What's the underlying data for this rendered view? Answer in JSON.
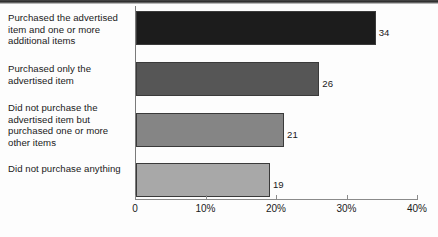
{
  "chart_data": {
    "type": "bar",
    "orientation": "horizontal",
    "title": "",
    "subtitle": "",
    "xlabel": "",
    "ylabel": "",
    "categories": [
      "Purchased the advertised item and one or more additional items",
      "Purchased only the advertised item",
      "Did not purchase the advertised item but purchased one or more other items",
      "Did not purchase anything"
    ],
    "values": [
      34,
      26,
      21,
      19
    ],
    "value_labels": [
      "34",
      "26",
      "21",
      "19"
    ],
    "xlim": [
      0,
      40
    ],
    "xticks": [
      0,
      10,
      20,
      30,
      40
    ],
    "xtick_labels": [
      "0",
      "10%",
      "20%",
      "30%",
      "40%"
    ],
    "grid": false,
    "legend": "none",
    "bar_colors": [
      "#1c1c1c",
      "#565656",
      "#858585",
      "#a8a8a8"
    ],
    "bar_border_color": "#3a3a3a",
    "axis_color": "#8a8a8a",
    "background_color": "#fdfdfd"
  }
}
